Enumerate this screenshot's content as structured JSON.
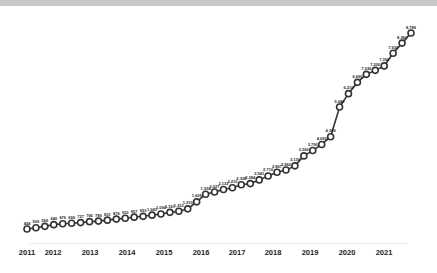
{
  "chart_data": {
    "type": "line",
    "title": "",
    "xlabel": "",
    "ylabel": "",
    "grid": false,
    "legend": null,
    "x_ticks": [
      "2011",
      "2012",
      "2013",
      "2014",
      "2015",
      "2016",
      "2017",
      "2018",
      "2019",
      "2020",
      "2021"
    ],
    "x_tick_positions": [
      27,
      53,
      90,
      127,
      164,
      201,
      237,
      273,
      310,
      347,
      384
    ],
    "series": [
      {
        "name": "value",
        "color": "#333333",
        "marker": "hollow-circle",
        "values": [
          454,
          509,
          566,
          640,
          676,
          699,
          727,
          766,
          789,
          831,
          876,
          910,
          957,
          993,
          1043,
          1094,
          1161,
          1212,
          1310,
          1609,
          1934,
          2027,
          2132,
          2210,
          2338,
          2384,
          2541,
          2710,
          2867,
          2960,
          3139,
          3563,
          3790,
          4050,
          4380,
          5640,
          6210,
          6690,
          7030,
          7200,
          7390,
          7930,
          8360,
          8789
        ],
        "labels": [
          "454",
          "509",
          "566",
          "640",
          "676",
          "699",
          "727",
          "766",
          "789",
          "831",
          "876",
          "910",
          "957",
          "993",
          "1,043",
          "1,094",
          "1,161",
          "1,212",
          "1,310",
          "1,609",
          "1,934",
          "2,027",
          "2,132",
          "2,210",
          "2,338",
          "2,384",
          "2,541",
          "2,710",
          "2,867",
          "2,960",
          "3,139",
          "3,563",
          "3,790",
          "4,050",
          "4,380",
          "5,640",
          "6,210",
          "6,690",
          "7,030",
          "7,200",
          "7,390",
          "7,930",
          "8,360",
          "8,789"
        ]
      }
    ],
    "ylim": [
      0,
      9500
    ]
  }
}
